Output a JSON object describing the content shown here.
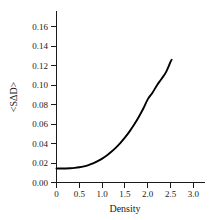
{
  "chart_data": {
    "type": "line",
    "title": "",
    "xlabel": "Density",
    "ylabel": "<SΔD>",
    "xlim": [
      0,
      3.25
    ],
    "ylim": [
      0,
      0.172
    ],
    "grid": false,
    "legend": null,
    "x_ticks": [
      0,
      0.5,
      1.0,
      1.5,
      2.0,
      2.5,
      3.0
    ],
    "x_tick_labels": [
      "0",
      "0.5",
      "1.0",
      "1.5",
      "2.0",
      "2.5",
      "3.0"
    ],
    "y_ticks": [
      0.0,
      0.02,
      0.04,
      0.06,
      0.08,
      0.1,
      0.12,
      0.14,
      0.16
    ],
    "y_tick_labels": [
      "0.00",
      "0.02",
      "0.04",
      "0.06",
      "0.08",
      "0.10",
      "0.12",
      "0.14",
      "0.16"
    ],
    "series": [
      {
        "name": "curve",
        "color": "#000000",
        "x": [
          0.0,
          0.1,
          0.2,
          0.3,
          0.4,
          0.5,
          0.6,
          0.7,
          0.8,
          0.9,
          1.0,
          1.1,
          1.2,
          1.3,
          1.4,
          1.5,
          1.6,
          1.7,
          1.8,
          1.9,
          2.0,
          2.1,
          2.2,
          2.3,
          2.4,
          2.5,
          2.52
        ],
        "y": [
          0.014,
          0.014,
          0.0141,
          0.0143,
          0.0147,
          0.0153,
          0.0162,
          0.0175,
          0.0192,
          0.0214,
          0.024,
          0.0271,
          0.0308,
          0.035,
          0.0398,
          0.0452,
          0.0513,
          0.0581,
          0.0657,
          0.0742,
          0.0836,
          0.09,
          0.0976,
          0.104,
          0.111,
          0.1215,
          0.123
        ]
      }
    ]
  },
  "labels": {
    "x_axis_title": "Density",
    "y_axis_title": "<SΔD>"
  }
}
